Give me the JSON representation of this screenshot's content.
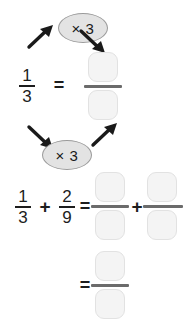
{
  "worksheet": {
    "multipliers": [
      {
        "label": "× 3"
      },
      {
        "label": "× 3"
      }
    ],
    "equivalence_row": {
      "fraction": {
        "numerator": "1",
        "denominator": "3"
      },
      "equals": "=",
      "answer": {
        "numerator": "",
        "denominator": ""
      }
    },
    "sum_row": {
      "first_fraction": {
        "numerator": "1",
        "denominator": "3"
      },
      "plus": "+",
      "second_fraction": {
        "numerator": "2",
        "denominator": "9"
      },
      "equals": "=",
      "answer_first": {
        "numerator": "",
        "denominator": ""
      },
      "answer_plus": "+",
      "answer_second": {
        "numerator": "",
        "denominator": ""
      }
    },
    "result_row": {
      "equals": "=",
      "answer": {
        "numerator": "",
        "denominator": ""
      }
    },
    "icons": {
      "arrow_up_right": "arrow-up-right-icon",
      "arrow_down_right": "arrow-down-right-icon"
    },
    "colors": {
      "box_fill": "#f4f4f4",
      "box_border": "#e2e2e2",
      "oval_fill": "#e3e3e3",
      "oval_border": "#9a9a9a",
      "ink": "#1d1d1d",
      "bar": "#6b6b6b"
    }
  }
}
